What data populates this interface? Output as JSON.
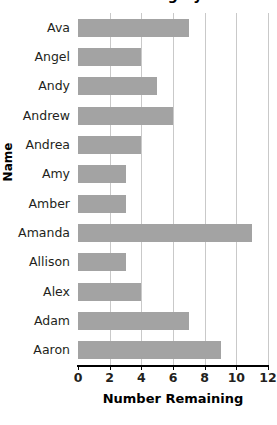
{
  "chart_data": {
    "type": "bar",
    "orientation": "horizontal",
    "title": "Number Remaining by Name",
    "xlabel": "Number Remaining",
    "ylabel": "Name",
    "categories": [
      "Ava",
      "Angel",
      "Andy",
      "Andrew",
      "Andrea",
      "Amy",
      "Amber",
      "Amanda",
      "Allison",
      "Alex",
      "Adam",
      "Aaron"
    ],
    "values": [
      7,
      4,
      5,
      6,
      4,
      3,
      3,
      11,
      3,
      4,
      7,
      9
    ],
    "xlim": [
      0,
      12
    ],
    "xticks": [
      0,
      2,
      4,
      6,
      8,
      10,
      12
    ],
    "xtick_labels": [
      "0",
      "2",
      "4",
      "6",
      "8",
      "10",
      "12"
    ],
    "grid": "vertical",
    "legend": "none",
    "bar_color": "#a3a3a3",
    "gridline_color": "#c9c9c9",
    "axis_color": "#000000",
    "text_color": "#231f20"
  }
}
